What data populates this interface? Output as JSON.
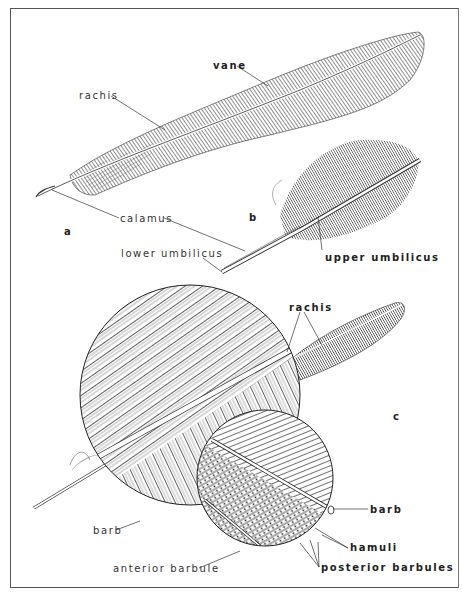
{
  "figure": {
    "panels": {
      "a": "a",
      "b": "b",
      "c": "c"
    },
    "labels": {
      "vane": "vane",
      "rachis_top": "rachis",
      "calamus": "calamus",
      "lower_umbilicus": "lower umbilicus",
      "upper_umbilicus": "upper umbilicus",
      "rachis_bottom": "rachis",
      "barb_right": "barb",
      "barb_left": "barb",
      "hamuli": "hamuli",
      "anterior_barbule": "anterior barbule",
      "posterior_barbules": "posterior barbules"
    },
    "colors": {
      "ink": "#222222",
      "paper": "#ffffff",
      "frame": "#555555"
    }
  }
}
